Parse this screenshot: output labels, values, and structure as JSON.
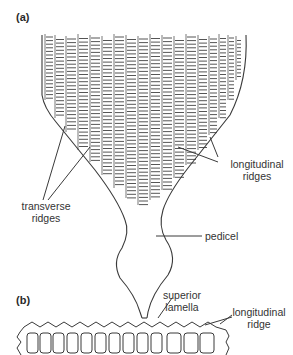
{
  "figure": {
    "panel_a": {
      "label": "(a)",
      "annotations": {
        "transverse_ridges": [
          "transverse",
          "ridges"
        ],
        "longitudinal_ridges": [
          "longitudinal",
          "ridges"
        ],
        "pedicel": "pedicel"
      }
    },
    "panel_b": {
      "label": "(b)",
      "annotations": {
        "superior_lamella": [
          "superior",
          "lamella"
        ],
        "longitudinal_ridge": [
          "longitudinal",
          "ridge"
        ]
      }
    },
    "colors": {
      "line": "#3a3a3a",
      "ridge": "#555555",
      "background": "#ffffff"
    }
  }
}
